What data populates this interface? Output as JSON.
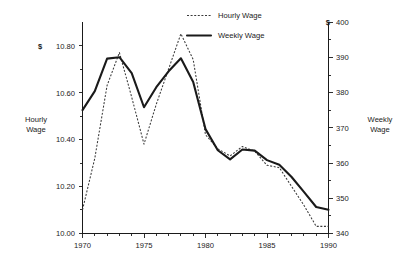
{
  "chart_data": {
    "type": "line",
    "title": "",
    "subtitle": "",
    "xlabel": "",
    "ylabel": "Hourly Wage",
    "y2label": "Weekly Wage",
    "grid": false,
    "legend_position": "top-center",
    "x": [
      1970,
      1971,
      1972,
      1973,
      1974,
      1975,
      1976,
      1977,
      1978,
      1979,
      1980,
      1981,
      1982,
      1983,
      1984,
      1985,
      1986,
      1987,
      1988,
      1989,
      1990
    ],
    "xlim": [
      1970,
      1990
    ],
    "xticks": [
      1970,
      1975,
      1980,
      1985,
      1990
    ],
    "xtick_labels": [
      "1970",
      "1975",
      "1980",
      "1985",
      "1990"
    ],
    "minor_xticks_every": 1,
    "axes": [
      {
        "side": "left",
        "label": "Hourly Wage",
        "currency_symbol": "$",
        "ylim": [
          10.0,
          10.9
        ],
        "yticks": [
          10.0,
          10.2,
          10.4,
          10.6,
          10.8
        ],
        "ytick_labels": [
          "10.00",
          "10.20",
          "10.40",
          "10.60",
          "10.80"
        ],
        "minor_ticks": true
      },
      {
        "side": "right",
        "label": "Weekly Wage",
        "currency_symbol": "$",
        "ylim": [
          340,
          400
        ],
        "yticks": [
          340,
          350,
          360,
          370,
          380,
          390,
          400
        ],
        "ytick_labels": [
          "340",
          "350",
          "360",
          "370",
          "380",
          "390",
          "400"
        ],
        "minor_ticks": true
      }
    ],
    "series": [
      {
        "name": "Hourly Wage",
        "axis": "left",
        "style": "dotted",
        "color": "#3a3a3a",
        "values": [
          10.1,
          10.32,
          10.63,
          10.77,
          10.58,
          10.38,
          10.55,
          10.7,
          10.85,
          10.74,
          10.42,
          10.36,
          10.33,
          10.37,
          10.35,
          10.29,
          10.28,
          10.2,
          10.12,
          10.03,
          10.03
        ]
      },
      {
        "name": "Weekly Wage",
        "axis": "right",
        "style": "solid",
        "color": "#1a1a1a",
        "values": [
          375.0,
          380.4,
          389.6,
          390.0,
          385.5,
          375.8,
          381.5,
          386.0,
          389.7,
          383.0,
          369.6,
          363.6,
          361.0,
          363.8,
          363.5,
          360.8,
          359.5,
          356.0,
          351.8,
          347.5,
          346.7
        ]
      }
    ]
  },
  "legend": {
    "entries": [
      {
        "label": "Hourly Wage",
        "style": "dotted"
      },
      {
        "label": "Weekly Wage",
        "style": "solid"
      }
    ]
  },
  "left_axis": {
    "currency": "$",
    "title_line1": "Hourly",
    "title_line2": "Wage",
    "ticks": [
      "10.80",
      "10.60",
      "10.40",
      "10.20",
      "10.00"
    ]
  },
  "right_axis": {
    "currency": "$",
    "title_line1": "Weekly",
    "title_line2": "Wage",
    "ticks": [
      "400",
      "390",
      "380",
      "370",
      "360",
      "350",
      "340"
    ]
  },
  "x_axis": {
    "ticks": [
      "1970",
      "1975",
      "1980",
      "1985",
      "1990"
    ]
  }
}
